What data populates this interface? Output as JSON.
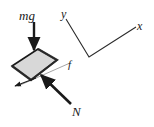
{
  "figure": {
    "kind": "free-body-diagram",
    "background_color": "#ffffff",
    "canvas": {
      "width": 154,
      "height": 127
    },
    "block": {
      "name": "block-on-incline",
      "fill_color": "#d8d8d8",
      "stroke_color": "#1a1a1a",
      "points": "12,66 38,49 57,60 31,80"
    },
    "labels": {
      "weight": "mg",
      "normal": "N",
      "friction": "f",
      "axis_y": "y",
      "axis_x": "x"
    },
    "vectors": {
      "weight": {
        "label": "mg",
        "description": "downward weight arrow",
        "color": "#1a1a1a",
        "x1": 34,
        "y1": 22,
        "x2": 34,
        "y2": 50
      },
      "normal": {
        "label": "N",
        "description": "normal force arrow pointing up-left into block",
        "color": "#1a1a1a",
        "x1": 71,
        "y1": 104,
        "x2": 40,
        "y2": 74
      },
      "friction": {
        "label": "f",
        "description": "friction force arrow pointing down-left along incline",
        "color": "#1a1a1a",
        "x1": 36,
        "y1": 78,
        "x2": 14,
        "y2": 87
      }
    },
    "incline_line": {
      "name": "incline-surface-line",
      "color": "#9a9a9a",
      "x1": 18,
      "y1": 86,
      "x2": 70,
      "y2": 63
    },
    "axes": {
      "color": "#2b2b2b",
      "vertex": {
        "x": 89,
        "y": 57
      },
      "y_end": {
        "x": 66,
        "y": 19
      },
      "x_end": {
        "x": 136,
        "y": 27
      }
    }
  }
}
